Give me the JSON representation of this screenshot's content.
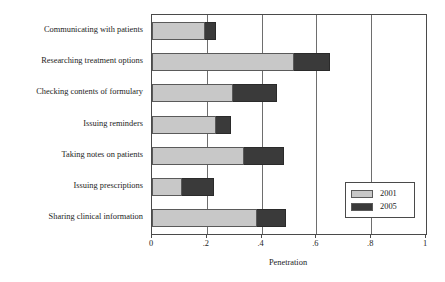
{
  "chart_data": {
    "type": "bar",
    "orientation": "horizontal",
    "stacked": true,
    "title": "",
    "xlabel": "Penetration",
    "ylabel": "",
    "xlim": [
      0,
      1
    ],
    "ylim": null,
    "grid": true,
    "legend_position": "bottom-right",
    "xticks": [
      0,
      0.2,
      0.4,
      0.6,
      0.8,
      1
    ],
    "xtick_labels": [
      "0",
      ".2",
      ".4",
      ".6",
      ".8",
      "1"
    ],
    "categories": [
      "Communicating with patients",
      "Researching treatment options",
      "Checking contents of formulary",
      "Issuing reminders",
      "Taking notes on patients",
      "Issuing prescriptions",
      "Sharing clinical information"
    ],
    "series": [
      {
        "name": "2001",
        "color": "#c8c8c8",
        "values": [
          0.195,
          0.52,
          0.295,
          0.235,
          0.335,
          0.11,
          0.385
        ]
      },
      {
        "name": "2005",
        "color": "#3a3a3a",
        "values": [
          0.234,
          0.65,
          0.455,
          0.29,
          0.48,
          0.225,
          0.49
        ]
      }
    ]
  },
  "legend": {
    "entries": [
      {
        "label": "2001",
        "color": "#c8c8c8"
      },
      {
        "label": "2005",
        "color": "#3a3a3a"
      }
    ]
  },
  "axis": {
    "x_title": "Penetration"
  }
}
